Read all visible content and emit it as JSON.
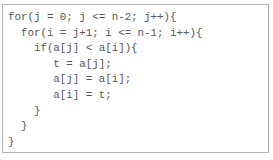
{
  "code_block": {
    "language": "c",
    "lines": [
      "for(j = 0; j <= n-2; j++){",
      "  for(i = j+1; i <= n-1; i++){",
      "    if(a[j] < a[i]){",
      "       t = a[j];",
      "       a[j] = a[i];",
      "       a[i] = t;",
      "    }",
      "  }",
      "}"
    ]
  },
  "colors": {
    "text": "#555555",
    "border": "#b0b0b0",
    "background": "#ffffff"
  }
}
